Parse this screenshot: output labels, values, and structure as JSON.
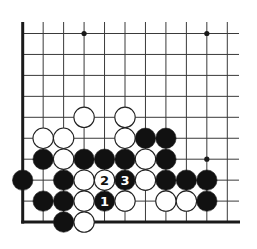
{
  "diagram": {
    "type": "go-problem",
    "grid": {
      "columns": 11,
      "rows": 10,
      "origin_x": 22.7,
      "origin_y": 33.5,
      "spacing_x": 20.46,
      "spacing_y": 20.95,
      "vertical_line_top": 22,
      "horizontal_line_right": 239,
      "edges": [
        "left",
        "bottom"
      ]
    },
    "colors": {
      "line": "#3a3a3a",
      "edge": "#1a1a1a",
      "black_stone": "#111111",
      "white_stone": "#ffffff",
      "stone_outline": "#222222"
    },
    "star_points": [
      {
        "col": 3,
        "row": 0
      },
      {
        "col": 9,
        "row": 0
      },
      {
        "col": 9,
        "row": 6
      }
    ],
    "stones": [
      {
        "col": 3,
        "row": 4,
        "color": "white"
      },
      {
        "col": 5,
        "row": 4,
        "color": "white"
      },
      {
        "col": 1,
        "row": 5,
        "color": "white"
      },
      {
        "col": 2,
        "row": 5,
        "color": "white"
      },
      {
        "col": 5,
        "row": 5,
        "color": "white"
      },
      {
        "col": 6,
        "row": 5,
        "color": "black"
      },
      {
        "col": 7,
        "row": 5,
        "color": "black"
      },
      {
        "col": 1,
        "row": 6,
        "color": "black"
      },
      {
        "col": 2,
        "row": 6,
        "color": "white"
      },
      {
        "col": 3,
        "row": 6,
        "color": "black"
      },
      {
        "col": 4,
        "row": 6,
        "color": "black"
      },
      {
        "col": 5,
        "row": 6,
        "color": "black"
      },
      {
        "col": 6,
        "row": 6,
        "color": "white"
      },
      {
        "col": 7,
        "row": 6,
        "color": "black"
      },
      {
        "col": 0,
        "row": 7,
        "color": "black"
      },
      {
        "col": 2,
        "row": 7,
        "color": "black"
      },
      {
        "col": 3,
        "row": 7,
        "color": "white"
      },
      {
        "col": 4,
        "row": 7,
        "color": "white",
        "label": "2"
      },
      {
        "col": 5,
        "row": 7,
        "color": "black",
        "label": "3"
      },
      {
        "col": 6,
        "row": 7,
        "color": "white"
      },
      {
        "col": 7,
        "row": 7,
        "color": "black"
      },
      {
        "col": 8,
        "row": 7,
        "color": "black"
      },
      {
        "col": 9,
        "row": 7,
        "color": "black"
      },
      {
        "col": 1,
        "row": 8,
        "color": "black"
      },
      {
        "col": 2,
        "row": 8,
        "color": "black"
      },
      {
        "col": 3,
        "row": 8,
        "color": "white"
      },
      {
        "col": 4,
        "row": 8,
        "color": "black",
        "label": "1"
      },
      {
        "col": 5,
        "row": 8,
        "color": "white"
      },
      {
        "col": 7,
        "row": 8,
        "color": "white"
      },
      {
        "col": 8,
        "row": 8,
        "color": "white"
      },
      {
        "col": 9,
        "row": 8,
        "color": "black"
      },
      {
        "col": 2,
        "row": 9,
        "color": "black"
      },
      {
        "col": 3,
        "row": 9,
        "color": "white"
      }
    ]
  }
}
